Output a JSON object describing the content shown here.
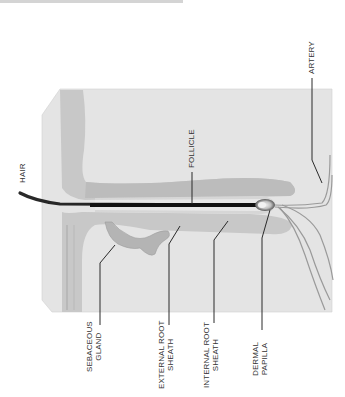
{
  "diagram": {
    "orientation": "rotated 90 degrees counter-clockwise",
    "labels": {
      "hair": "HAIR",
      "follicle": "FOLLICLE",
      "artery": "ARTERY",
      "sebaceous_gland": [
        "SEBACEOUS",
        "GLAND"
      ],
      "external_root_sheath": [
        "EXTERNAL ROOT",
        "SHEATH"
      ],
      "internal_root_sheath": [
        "INTERNAL ROOT",
        "SHEATH"
      ],
      "dermal_papilla": [
        "DERMAL",
        "PAPILLA"
      ]
    },
    "colors": {
      "skin_block": "#e3e3e3",
      "epidermis": "#c4c4c4",
      "sheath": "#bdbdbd",
      "hair_shaft": "#1e1e1e",
      "leader_line": "#2a2a2a",
      "vessel": "#9a9a9a",
      "label_text": "#333333"
    }
  }
}
